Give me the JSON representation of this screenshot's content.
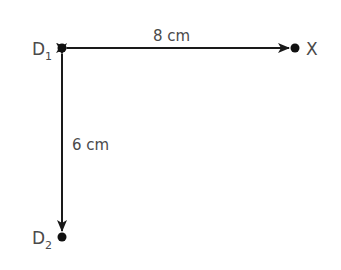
{
  "diagram": {
    "points": {
      "d1": {
        "label": "D",
        "subscript": "1"
      },
      "d2": {
        "label": "D",
        "subscript": "2"
      },
      "x": {
        "label": "X"
      }
    },
    "distances": {
      "d1_to_x": "8 cm",
      "d1_to_d2": "6 cm"
    },
    "colors": {
      "line": "#1a1a1a",
      "text": "#4a4a4a"
    }
  }
}
